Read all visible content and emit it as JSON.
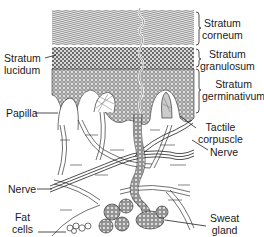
{
  "diagram": {
    "labels": {
      "stratum_corneum": [
        "Stratum",
        "corneum"
      ],
      "stratum_granulosum": [
        "Stratum",
        "granulosum"
      ],
      "stratum_germinativum": [
        "Stratum",
        "germinativum"
      ],
      "stratum_lucidum": [
        "Stratum",
        "lucidum"
      ],
      "papilla": "Papilla",
      "tactile_corpuscle": [
        "Tactile",
        "corpuscle"
      ],
      "nerve_right": "Nerve",
      "nerve_left": "Nerve",
      "fat_cells": [
        "Fat",
        "cells"
      ],
      "sweat_gland": [
        "Sweat",
        "gland"
      ]
    },
    "colors": {
      "ink": "#1a1a1a",
      "paper": "#ffffff"
    }
  }
}
